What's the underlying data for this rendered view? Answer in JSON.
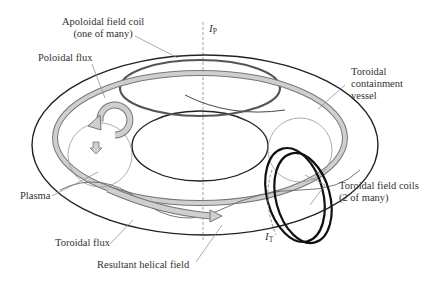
{
  "diagram": {
    "type": "tokamak-schematic",
    "labels": {
      "apoloidal_coil_line1": "Apoloidal field coil",
      "apoloidal_coil_line2": "(one of many)",
      "poloidal_flux": "Poloidal flux",
      "toroidal_vessel_line1": "Toroidal",
      "toroidal_vessel_line2": "containment",
      "toroidal_vessel_line3": "vessel",
      "plasma": "Plasma",
      "toroidal_coils_line1": "Toroidal field coils",
      "toroidal_coils_line2": "(2 of many)",
      "toroidal_flux": "Toroidal flux",
      "helical_field": "Resultant helical field",
      "current_p": "I",
      "current_p_sub": "P",
      "current_t": "I",
      "current_t_sub": "T"
    },
    "colors": {
      "line": "#222222",
      "coil": "#555555",
      "flux_fill": "#c8c8c8",
      "flux_stroke": "#777777",
      "thin": "#999999",
      "text": "#333333"
    }
  }
}
